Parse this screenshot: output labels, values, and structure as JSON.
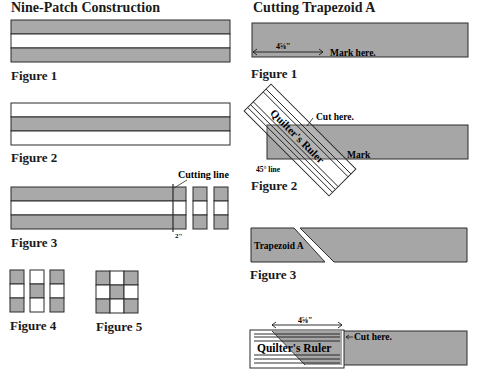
{
  "left_panel": {
    "title": "Nine-Patch Construction",
    "figures": [
      {
        "label": "Figure 1",
        "description": "Strip set: dark / light / dark",
        "bands": [
          "dark",
          "light",
          "dark"
        ]
      },
      {
        "label": "Figure 2",
        "description": "Strip set: light / dark / light",
        "bands": [
          "light",
          "dark",
          "light"
        ]
      },
      {
        "label": "Figure 3",
        "description": "Strip set cut into 2\" segments",
        "cutting_line_label": "Cutting line",
        "segment_width_label": "2\""
      },
      {
        "label": "Figure 4",
        "description": "Three segments arranged side by side",
        "columns": [
          [
            "dark",
            "light",
            "dark"
          ],
          [
            "light",
            "dark",
            "light"
          ],
          [
            "dark",
            "light",
            "dark"
          ]
        ]
      },
      {
        "label": "Figure 5",
        "description": "Completed nine-patch block",
        "grid": [
          [
            "dark",
            "light",
            "dark"
          ],
          [
            "light",
            "dark",
            "light"
          ],
          [
            "dark",
            "light",
            "dark"
          ]
        ]
      }
    ]
  },
  "right_panel": {
    "title": "Cutting Trapezoid A",
    "figures": [
      {
        "label": "Figure 1",
        "measurement": "4⅝\"",
        "annotation": "Mark here."
      },
      {
        "label": "Figure 2",
        "ruler_text": "Quilter's Ruler",
        "cut_annotation": "Cut here.",
        "mark_annotation": "Mark",
        "angle_annotation": "45° line"
      },
      {
        "label": "Figure 3",
        "piece_label": "Trapezoid A"
      },
      {
        "label": "",
        "measurement": "4⅝\"",
        "ruler_text": "Quilter's Ruler",
        "cut_annotation": "Cut here."
      }
    ]
  },
  "colors": {
    "dark_fabric": "#a9a9a9",
    "light_fabric": "#ffffff",
    "outline": "#2b2b2b",
    "text": "#1a1a1a"
  }
}
